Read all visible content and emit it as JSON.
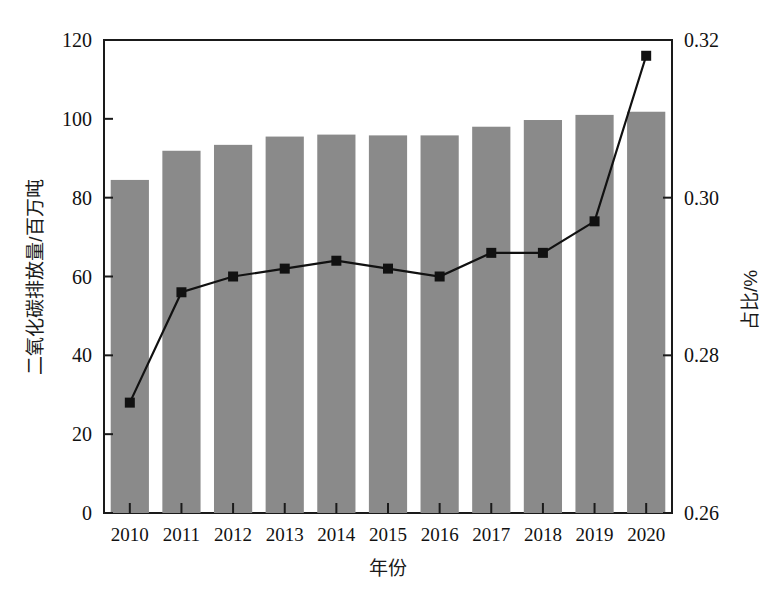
{
  "chart_data": {
    "type": "bar",
    "title": "",
    "subtitle": "",
    "xlabel": "年份",
    "ylabel": "二氧化碳排放量/百万吨",
    "y2label": "占比/%",
    "categories": [
      "2010",
      "2011",
      "2012",
      "2013",
      "2014",
      "2015",
      "2016",
      "2017",
      "2018",
      "2019",
      "2020"
    ],
    "ylim": [
      0,
      120
    ],
    "y2lim": [
      0.26,
      0.32
    ],
    "yticks": [
      "0",
      "20",
      "40",
      "60",
      "80",
      "100",
      "120"
    ],
    "ytick_values": [
      0,
      20,
      40,
      60,
      80,
      100,
      120
    ],
    "y2ticks": [
      "0.26",
      "0.28",
      "0.30",
      "0.32"
    ],
    "y2tick_values": [
      0.26,
      0.28,
      0.3,
      0.32
    ],
    "grid": false,
    "legend": "none",
    "series": [
      {
        "name": "二氧化碳排放量",
        "kind": "bar",
        "axis": "left",
        "unit": "百万吨",
        "color": "#8a8a8a",
        "values": [
          84.5,
          91.9,
          93.4,
          95.5,
          96.0,
          95.8,
          95.8,
          98.0,
          99.7,
          101.0,
          101.8
        ]
      },
      {
        "name": "占比",
        "kind": "line",
        "axis": "right",
        "unit": "%",
        "color": "#111111",
        "marker": "square",
        "values": [
          0.274,
          0.288,
          0.29,
          0.291,
          0.292,
          0.291,
          0.29,
          0.293,
          0.293,
          0.297,
          0.318
        ]
      }
    ]
  },
  "figure": {
    "background": "#ffffff",
    "frame_color": "#1a1a1a",
    "bar_color": "#8a8a8a",
    "line_color": "#111111"
  }
}
